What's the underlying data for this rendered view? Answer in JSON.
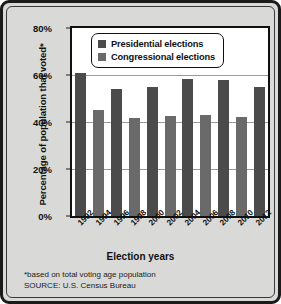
{
  "chart_data": {
    "type": "bar",
    "title": "",
    "xlabel": "Election years",
    "ylabel": "Percentage of population that voted*",
    "categories": [
      "1992",
      "1994",
      "1996",
      "1998",
      "2000",
      "2002",
      "2004",
      "2006",
      "2008",
      "2010",
      "2012"
    ],
    "series": [
      {
        "name": "Presidential elections",
        "color": "#4b4b4b",
        "points": [
          {
            "x": "1992",
            "y": 61
          },
          {
            "x": "1996",
            "y": 54
          },
          {
            "x": "2000",
            "y": 55
          },
          {
            "x": "2004",
            "y": 58.5
          },
          {
            "x": "2008",
            "y": 58
          },
          {
            "x": "2012",
            "y": 55
          }
        ]
      },
      {
        "name": "Congressional elections",
        "color": "#6a6a6a",
        "points": [
          {
            "x": "1994",
            "y": 45
          },
          {
            "x": "1998",
            "y": 41.5
          },
          {
            "x": "2002",
            "y": 42.5
          },
          {
            "x": "2006",
            "y": 43
          },
          {
            "x": "2010",
            "y": 42
          }
        ]
      }
    ],
    "values": [
      61,
      45,
      54,
      41.5,
      55,
      42.5,
      58.5,
      43,
      58,
      42,
      55
    ],
    "bar_types": [
      "presidential",
      "congressional",
      "presidential",
      "congressional",
      "presidential",
      "congressional",
      "presidential",
      "congressional",
      "presidential",
      "congressional",
      "presidential"
    ],
    "ylim": [
      0,
      80
    ],
    "yticks": [
      0,
      20,
      40,
      60,
      80
    ],
    "ytick_labels": [
      "0%",
      "20%",
      "40%",
      "60%",
      "80%"
    ],
    "grid": true,
    "legend_position": "top-center"
  },
  "legend": {
    "items": [
      {
        "label": "Presidential elections",
        "swatch": "presidential"
      },
      {
        "label": "Congressional elections",
        "swatch": "congressional"
      }
    ]
  },
  "footnotes": {
    "basis": "*based on total voting age population",
    "source": "SOURCE: U.S. Census Bureau"
  }
}
